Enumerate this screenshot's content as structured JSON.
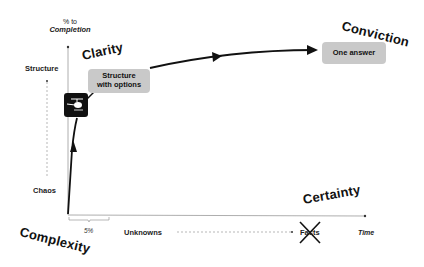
{
  "diagram": {
    "y_axis": {
      "title_line1": "% to",
      "title_line2": "Completion"
    },
    "x_axis": {
      "label": "Time"
    },
    "y_scale": {
      "top": "Structure",
      "bottom": "Chaos"
    },
    "x_scale": {
      "left": "Unknowns",
      "right": "Facts",
      "right_crossed_out": true
    },
    "bracket_label": "5%",
    "corner_labels": {
      "bottom_left": "Complexity",
      "top_left": "Clarity",
      "top_right": "Conviction",
      "bottom_right": "Certainty"
    },
    "boxes": {
      "structure_options_line1": "Structure",
      "structure_options_line2": "with options",
      "one_answer": "One answer"
    },
    "icons": {
      "helicopter": "helicopter-icon",
      "cross": "x-cross-icon"
    },
    "colors": {
      "line": "#111111",
      "box_fill": "#c9c9c9",
      "axis": "#888888"
    }
  }
}
